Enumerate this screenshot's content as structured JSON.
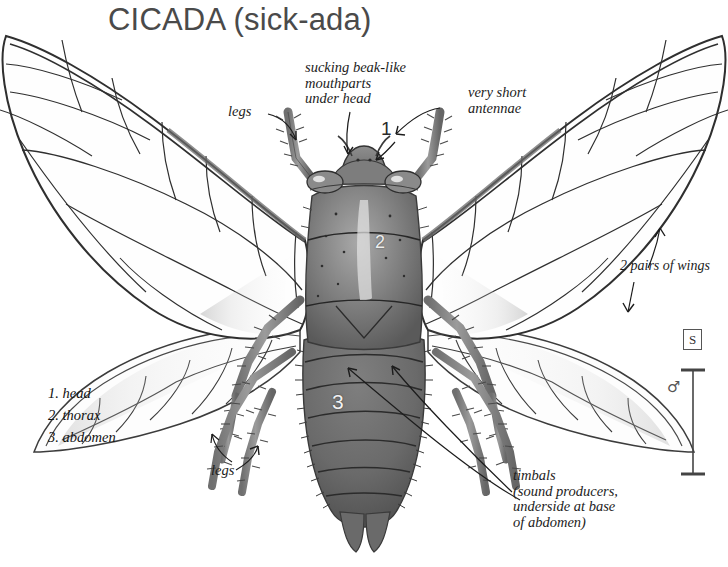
{
  "title": "CICADA (sick-ada)",
  "figure": {
    "subject": "cicada",
    "view": "dorsal",
    "style": "pencil-shaded scientific illustration"
  },
  "annotations": {
    "mouthparts": "sucking beak-like\nmouthparts\nunder head",
    "antennae": "very short\nantennae",
    "legs_upper": "legs",
    "legs_lower": "legs",
    "wings": "2 pairs of wings",
    "timbals": "timbals\n(sound producers,\nunderside at base\nof abdomen)"
  },
  "body_numbers": {
    "head": "1",
    "thorax": "2",
    "abdomen": "3"
  },
  "legend": {
    "items": [
      "1. head",
      "2. thorax",
      "3. abdomen"
    ]
  },
  "scale": {
    "size_code": "S",
    "sex_symbol": "♂"
  },
  "colors": {
    "background": "#ffffff",
    "title": "#4a4a4a",
    "ink": "#1c1c1c",
    "body_dark": "#6d6d6d",
    "body_mid": "#8e8e8e",
    "wing_line": "#3c3c3c"
  }
}
